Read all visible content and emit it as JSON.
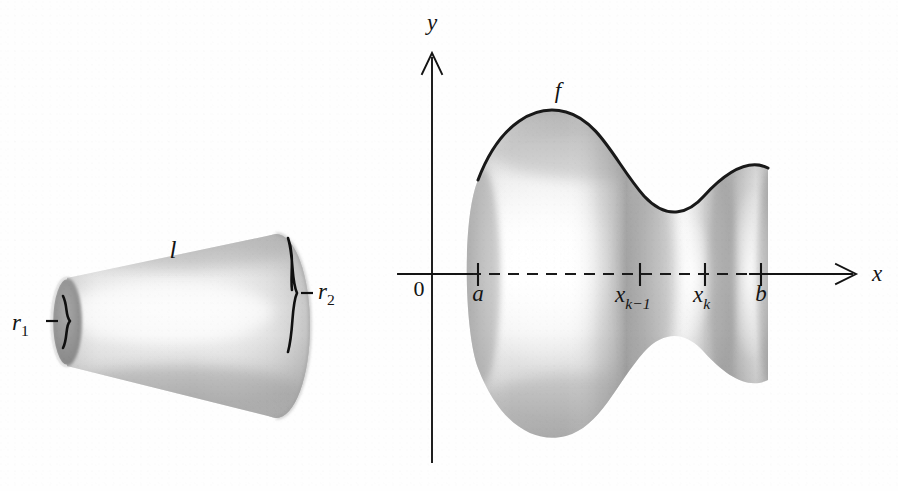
{
  "figure": {
    "background_color": "#fefefe",
    "ink_color": "#141414",
    "width": 898,
    "height": 491,
    "caption": ""
  },
  "left_panel": {
    "name": "conical-frustum-band",
    "description": "Shaded conical frustum (cone band) shown in three-dimensional perspective, small circular end at lower left and large circular end at right.",
    "labels": {
      "slant_height": "l",
      "small_radius_base": "r",
      "small_radius_sub": "1",
      "large_radius_base": "r",
      "large_radius_sub": "2"
    },
    "geometry": {
      "small_ellipse_center_x": 67,
      "small_ellipse_center_y": 322,
      "small_ellipse_rx": 15,
      "small_ellipse_ry": 44,
      "large_ellipse_center_x": 276,
      "large_ellipse_center_y": 326,
      "large_ellipse_rx": 34,
      "large_ellipse_ry": 92,
      "slant_label_x": 173,
      "slant_label_y": 258,
      "r1_label_x": 12,
      "r1_label_y": 330,
      "r2_label_x": 318,
      "r2_label_y": 299
    }
  },
  "right_panel": {
    "name": "surface-of-revolution-plot",
    "description": "Surface of revolution generated by rotating the curve y = f(x) about the x-axis, between x = a and x = b, with a subinterval from x_{k-1} to x_k highlighted.",
    "axes": {
      "x_axis_label": "x",
      "y_axis_label": "y",
      "origin_label": "0",
      "x_axis_y": 274,
      "y_axis_x": 432,
      "x_axis_left": 398,
      "x_axis_right": 856,
      "y_axis_top": 52,
      "y_axis_bottom": 462,
      "x_label_x": 872,
      "x_label_y": 281,
      "y_label_x": 432,
      "y_label_y": 30,
      "origin_label_x": 419,
      "origin_label_y": 292
    },
    "curve": {
      "function_label": "f",
      "function_label_x": 558,
      "function_label_y": 98,
      "start_x": 478,
      "end_x": 768,
      "peak_x": 566,
      "peak_y": 112,
      "valley_x": 692,
      "valley_y": 206,
      "right_rise_y": 168
    },
    "ticks": [
      {
        "id": "tick-a",
        "label_base": "a",
        "label_sub": "",
        "x": 478,
        "label_x": 478,
        "label_y": 297
      },
      {
        "id": "tick-xk-1",
        "label_base": "x",
        "label_sub": "k−1",
        "x": 640,
        "label_x": 638,
        "label_y": 298
      },
      {
        "id": "tick-xk",
        "label_base": "x",
        "label_sub": "k",
        "x": 705,
        "label_x": 704,
        "label_y": 298
      },
      {
        "id": "tick-b",
        "label_base": "b",
        "label_sub": "",
        "x": 761,
        "label_x": 761,
        "label_y": 297
      }
    ],
    "dashed_axis_segment": {
      "from_x": 470,
      "to_x": 752,
      "y": 274
    }
  }
}
